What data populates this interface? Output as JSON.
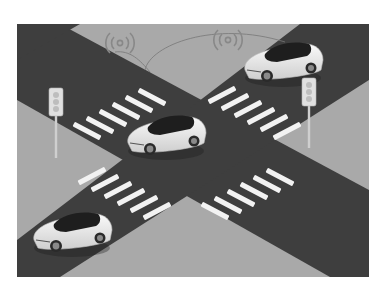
{
  "scene": {
    "title": "Connected autonomous vehicles at a four-way intersection",
    "colors": {
      "background": "#ffffff",
      "sidewalk": "#a9a9a9",
      "road": "#3e3e3e",
      "crosswalk": "#f2f2f2",
      "car_body": "#ececec",
      "car_glass": "#1e1e1e",
      "signal_arc": "#777777",
      "traffic_light": "#dcdcdc"
    },
    "elements": {
      "cars": [
        "car-top-right",
        "car-center",
        "car-bottom-left"
      ],
      "traffic_lights": [
        "traffic-light-left",
        "traffic-light-right"
      ],
      "wireless_icons": [
        "wireless-signal-left",
        "wireless-signal-right"
      ],
      "crosswalks": [
        "crosswalk-top-left",
        "crosswalk-top-right",
        "crosswalk-bottom-left",
        "crosswalk-bottom-right"
      ]
    }
  }
}
